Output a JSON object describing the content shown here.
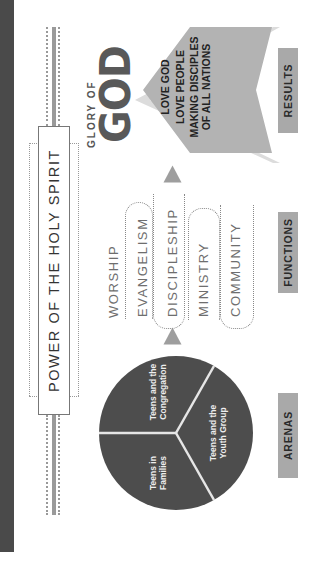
{
  "title_banner": "POWER OF THE HOLY SPIRIT",
  "results": {
    "heading_small": "GLORY OF",
    "heading_large": "GOD",
    "items": [
      "LOVE GOD",
      "LOVE PEOPLE",
      "MAKING DISCIPLES",
      "OF ALL NATIONS"
    ],
    "label": "RESULTS"
  },
  "functions": {
    "items": [
      "WORSHIP",
      "EVANGELISM",
      "DISCIPLESHIP",
      "MINISTRY",
      "COMMUNITY"
    ],
    "label": "FUNCTIONS"
  },
  "arenas": {
    "segments": [
      {
        "line1": "Teens and the",
        "line2": "Congregation"
      },
      {
        "line1": "Teens and the",
        "line2": "Youth Group"
      },
      {
        "line1": "Teens in",
        "line2": "Families"
      }
    ],
    "label": "ARENAS"
  },
  "colors": {
    "dark_bar": "#4a4a4a",
    "pie": "#4d4d4d",
    "chevron_main": "#b3b3b3",
    "chevron_back": "#d9d9d9",
    "label_box": "#a9a9a9",
    "arrow": "#9e9e9e"
  }
}
